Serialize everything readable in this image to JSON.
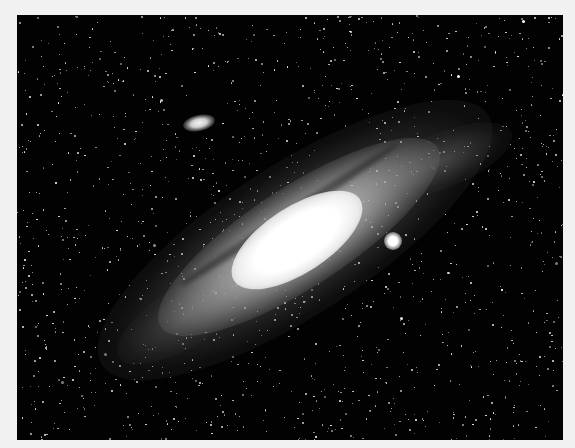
{
  "image": {
    "subject": "Andromeda Galaxy",
    "style": "grayscale astrophotograph",
    "frame": {
      "x": 17,
      "y": 15,
      "width": 546,
      "height": 425
    },
    "colors": {
      "border": "#f1f1f1",
      "sky": "#020202",
      "stars": "#ffffff",
      "core": "#ffffff"
    },
    "objects": [
      {
        "name": "spiral-galaxy",
        "center": [
          297,
          240
        ],
        "tilt_deg": -33
      },
      {
        "name": "satellite-galaxy-round",
        "center": [
          393,
          241
        ]
      },
      {
        "name": "satellite-galaxy-elliptical",
        "center": [
          199,
          123
        ]
      }
    ],
    "star_count": 1400
  }
}
